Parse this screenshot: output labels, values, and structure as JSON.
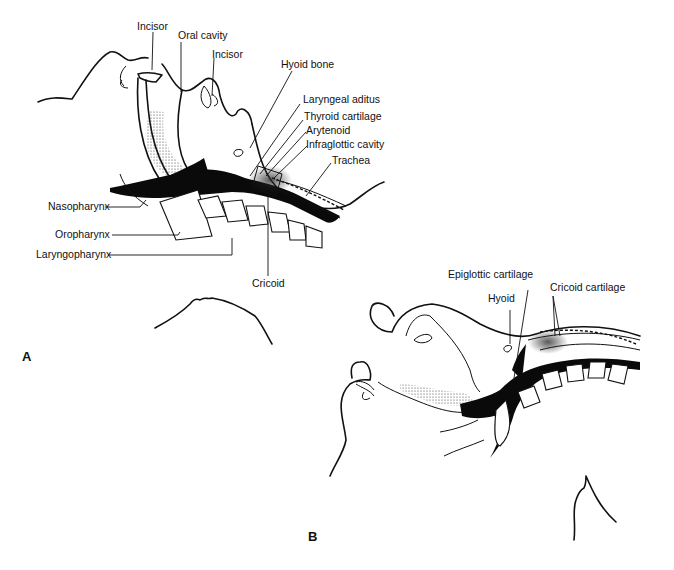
{
  "figure": {
    "panel_a": {
      "label": "A",
      "structures": [
        {
          "label": "Incisor"
        },
        {
          "label": "Oral cavity"
        },
        {
          "label": "Incisor"
        },
        {
          "label": "Hyoid bone"
        },
        {
          "label": "Laryngeal aditus"
        },
        {
          "label": "Thyroid cartilage"
        },
        {
          "label": "Arytenoid"
        },
        {
          "label": "Infraglottic cavity"
        },
        {
          "label": "Trachea"
        },
        {
          "label": "Nasopharynx"
        },
        {
          "label": "Oropharynx"
        },
        {
          "label": "Laryngopharynx"
        },
        {
          "label": "Cricoid"
        }
      ]
    },
    "panel_b": {
      "label": "B",
      "structures": [
        {
          "label": "Epiglottic cartilage"
        },
        {
          "label": "Hyoid"
        },
        {
          "label": "Cricoid cartilage"
        }
      ]
    }
  }
}
